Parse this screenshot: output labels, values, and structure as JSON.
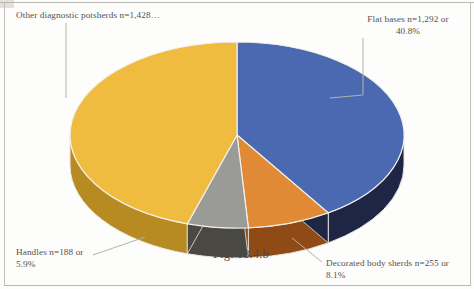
{
  "figure": {
    "caption": "Fig. 18.4.b",
    "background_color": "#fdfdfb",
    "label_color": "#55524e"
  },
  "chart_data": {
    "type": "pie",
    "title": "Fig. 18.4.b",
    "three_d": true,
    "legend_position": "callout-labels",
    "categories": [
      "Flat bases",
      "Decorated body sherds",
      "Handles",
      "Other diagnostic potsherds"
    ],
    "values": [
      1292,
      255,
      188,
      1428
    ],
    "percents": [
      40.8,
      8.1,
      5.9,
      45.2
    ],
    "slices": [
      {
        "name": "Flat bases",
        "label": "Flat bases  n=1,292 or\n40.8%",
        "count": 1292,
        "percent": 40.8,
        "top_color": "#4a69b0",
        "side_color": "#1e2545",
        "start_angle": 0,
        "end_angle": 146.9
      },
      {
        "name": "Decorated body sherds",
        "label": "Decorated body sherds  n=255 or\n8.1%",
        "count": 255,
        "percent": 8.1,
        "top_color": "#e08a36",
        "side_color": "#8f4a16",
        "start_angle": 146.9,
        "end_angle": 176.1
      },
      {
        "name": "Handles",
        "label": "Handles n=188 or\n5.9%",
        "count": 188,
        "percent": 5.9,
        "top_color": "#9a9a96",
        "side_color": "#4a4843",
        "start_angle": 176.1,
        "end_angle": 197.3
      },
      {
        "name": "Other diagnostic potsherds",
        "label": "Other diagnostic potsherds n=1,428…",
        "count": 1428,
        "percent": 45.2,
        "top_color": "#f0bc40",
        "side_color": "#b88a22",
        "start_angle": 197.3,
        "end_angle": 360
      }
    ]
  }
}
